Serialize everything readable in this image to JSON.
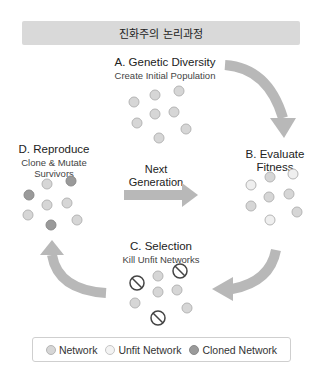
{
  "header": {
    "title": "진화주의 논리과정"
  },
  "stages": {
    "a": {
      "title": "A. Genetic Diversity",
      "subtitle": "Create Initial Population"
    },
    "b": {
      "title": "B. Evaluate",
      "title2": "Fitness"
    },
    "c": {
      "title": "C. Selection",
      "subtitle": "Kill Unfit Networks"
    },
    "d": {
      "title": "D. Reproduce",
      "subtitle": "Clone & Mutate",
      "subtitle2": "Survivors"
    }
  },
  "center_arrow": {
    "line1": "Next",
    "line2": "Generation"
  },
  "legend": {
    "items": [
      {
        "label": "Network",
        "icon": "network-dot"
      },
      {
        "label": "Unfit Network",
        "icon": "unfit-network-dot"
      },
      {
        "label": "Cloned Network",
        "icon": "cloned-network-dot"
      }
    ]
  },
  "colors": {
    "network": "#d6d6d6",
    "unfit": "#f0f0f0",
    "cloned": "#9a9a9a",
    "arrow": "#b5b5b5",
    "header_bg": "#d9d9d9"
  }
}
